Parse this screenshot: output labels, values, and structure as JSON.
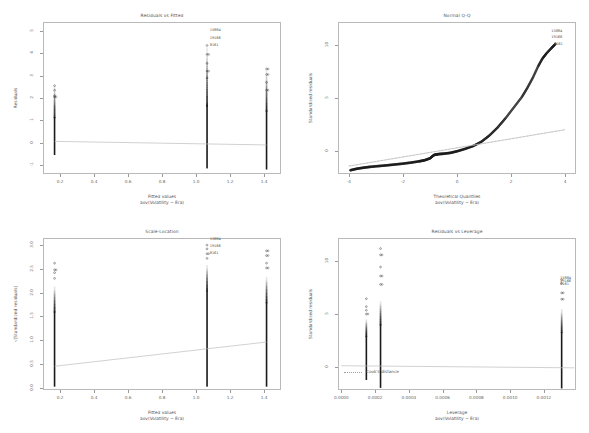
{
  "figure": {
    "kind": "r-diagnostic-plots",
    "panels": 4,
    "model_formula": "aov(Volatility ~ Era)",
    "background": "#ffffff",
    "point_color": "#1a1a1a",
    "line_color": "#bdbdbd",
    "frame_color": "#b9b9b9"
  },
  "chart_data": [
    {
      "type": "scatter",
      "id": "residuals-vs-fitted",
      "title": "Residuals vs Fitted",
      "xlabel": "Fitted values",
      "xsublabel": "aov(Volatility ~ Era)",
      "ylabel": "Residuals",
      "xlim": [
        0.1,
        1.5
      ],
      "ylim": [
        -1.4,
        5.4
      ],
      "xticks": [
        "0.2",
        "0.4",
        "0.6",
        "0.8",
        "1.0",
        "1.2",
        "1.4"
      ],
      "xtickvals": [
        0.2,
        0.4,
        0.6,
        0.8,
        1.0,
        1.2,
        1.4
      ],
      "yticks": [
        "5",
        "4",
        "3",
        "2",
        "1",
        "0",
        "-1"
      ],
      "ytickvals": [
        5,
        4,
        3,
        2,
        1,
        0,
        -1
      ],
      "grid": false,
      "legend": "none",
      "groups": [
        {
          "x": 0.168,
          "ymin": -0.55,
          "ymax": 2.55,
          "dense_to": 1.15,
          "outliers": [
            2.05,
            2.1,
            2.35,
            2.55
          ]
        },
        {
          "x": 1.065,
          "ymin": -1.15,
          "ymax": 4.35,
          "dense_to": 1.7,
          "outliers": [
            2.9,
            3.2,
            3.55,
            3.95,
            4.35
          ]
        },
        {
          "x": 1.415,
          "ymin": -1.2,
          "ymax": 3.3,
          "dense_to": 1.45,
          "outliers": [
            2.35,
            2.7,
            3.05,
            3.3
          ]
        }
      ],
      "smoother": {
        "x0": 0.168,
        "y0": 0.06,
        "x1": 1.415,
        "y1": -0.1
      },
      "point_labels": [
        {
          "text": "15884",
          "x": 1.075,
          "y": 5.05
        },
        {
          "text": "19166",
          "x": 1.075,
          "y": 4.7
        },
        {
          "text": "8161",
          "x": 1.075,
          "y": 4.35
        }
      ]
    },
    {
      "type": "scatter",
      "id": "normal-qq",
      "title": "Normal Q-Q",
      "xlabel": "Theoretical Quantiles",
      "xsublabel": "aov(Volatility ~ Era)",
      "ylabel": "Standardized residuals",
      "xlim": [
        -4.4,
        4.4
      ],
      "ylim": [
        -2.2,
        12.2
      ],
      "xticks": [
        "-4",
        "-2",
        "0",
        "2",
        "4"
      ],
      "xtickvals": [
        -4,
        -2,
        0,
        2,
        4
      ],
      "yticks": [
        "10",
        "5",
        "0"
      ],
      "ytickvals": [
        10,
        5,
        0
      ],
      "grid": false,
      "legend": "none",
      "reference_line": {
        "x0": -4.0,
        "y0": -1.45,
        "x1": 4.0,
        "y1": 2.0
      },
      "qq_curve": [
        [
          -3.95,
          -1.85
        ],
        [
          -3.7,
          -1.7
        ],
        [
          -3.45,
          -1.6
        ],
        [
          -3.2,
          -1.52
        ],
        [
          -2.9,
          -1.45
        ],
        [
          -2.6,
          -1.38
        ],
        [
          -2.3,
          -1.3
        ],
        [
          -2.0,
          -1.22
        ],
        [
          -1.7,
          -1.12
        ],
        [
          -1.4,
          -1.0
        ],
        [
          -1.2,
          -0.9
        ],
        [
          -1.0,
          -0.72
        ],
        [
          -0.85,
          -0.4
        ],
        [
          -0.7,
          -0.32
        ],
        [
          -0.5,
          -0.28
        ],
        [
          -0.25,
          -0.2
        ],
        [
          0.0,
          -0.05
        ],
        [
          0.3,
          0.18
        ],
        [
          0.6,
          0.45
        ],
        [
          0.9,
          0.85
        ],
        [
          1.2,
          1.45
        ],
        [
          1.5,
          2.2
        ],
        [
          1.8,
          3.1
        ],
        [
          2.1,
          4.1
        ],
        [
          2.4,
          5.1
        ],
        [
          2.6,
          5.95
        ],
        [
          2.8,
          6.9
        ],
        [
          3.0,
          8.0
        ],
        [
          3.15,
          8.7
        ],
        [
          3.3,
          9.2
        ],
        [
          3.5,
          9.75
        ],
        [
          3.65,
          10.15
        ]
      ],
      "point_labels": [
        {
          "text": "15884",
          "x": 3.45,
          "y": 11.35
        },
        {
          "text": "19166",
          "x": 3.45,
          "y": 10.75
        },
        {
          "text": "8161",
          "x": 3.55,
          "y": 10.15
        }
      ]
    },
    {
      "type": "scatter",
      "id": "scale-location",
      "title": "Scale-Location",
      "xlabel": "Fitted values",
      "xsublabel": "aov(Volatility ~ Era)",
      "ylabel": "√|Standardized residuals|",
      "xlim": [
        0.1,
        1.5
      ],
      "ylim": [
        -0.05,
        3.15
      ],
      "xticks": [
        "0.2",
        "0.4",
        "0.6",
        "0.8",
        "1.0",
        "1.2",
        "1.4"
      ],
      "xtickvals": [
        0.2,
        0.4,
        0.6,
        0.8,
        1.0,
        1.2,
        1.4
      ],
      "yticks": [
        "3.0",
        "2.5",
        "2.0",
        "1.5",
        "1.0",
        "0.5",
        "0.0"
      ],
      "ytickvals": [
        3.0,
        2.5,
        2.0,
        1.5,
        1.0,
        0.5,
        0.0
      ],
      "grid": false,
      "legend": "none",
      "groups": [
        {
          "x": 0.168,
          "ymin": 0.02,
          "ymax": 2.15,
          "dense_to": 1.6,
          "outliers": [
            2.3,
            2.42,
            2.48,
            2.62
          ]
        },
        {
          "x": 1.065,
          "ymin": 0.02,
          "ymax": 2.6,
          "dense_to": 2.05,
          "outliers": [
            2.72,
            2.82,
            2.92,
            3.0
          ]
        },
        {
          "x": 1.415,
          "ymin": 0.02,
          "ymax": 2.35,
          "dense_to": 1.8,
          "outliers": [
            2.52,
            2.62,
            2.78,
            2.88
          ]
        }
      ],
      "smoother": {
        "x0": 0.168,
        "y0": 0.45,
        "x1": 1.415,
        "y1": 0.96
      },
      "point_labels": [
        {
          "text": "15884",
          "x": 1.075,
          "y": 3.12
        },
        {
          "text": "19166",
          "x": 1.075,
          "y": 2.98
        },
        {
          "text": "8161",
          "x": 1.075,
          "y": 2.84
        }
      ]
    },
    {
      "type": "scatter",
      "id": "residuals-vs-leverage",
      "title": "Residuals vs Leverage",
      "xlabel": "Leverage",
      "xsublabel": "aov(Volatility ~ Era)",
      "ylabel": "Standardized residuals",
      "xlim": [
        -2e-05,
        0.00139
      ],
      "ylim": [
        -2.2,
        12.2
      ],
      "xticks": [
        "0.0000",
        "0.0002",
        "0.0004",
        "0.0006",
        "0.0008",
        "0.0010",
        "0.0012"
      ],
      "xtickvals": [
        0.0,
        0.0002,
        0.0004,
        0.0006,
        0.0008,
        0.001,
        0.0012
      ],
      "yticks": [
        "10",
        "5",
        "0"
      ],
      "ytickvals": [
        10,
        5,
        0
      ],
      "grid": false,
      "legend": "Cook's distance",
      "legend_position": "bottom-left",
      "groups": [
        {
          "x": 0.000148,
          "ymin": -1.25,
          "ymax": 4.55,
          "dense_to": 2.9,
          "outliers": [
            5.0,
            5.35,
            5.7,
            6.45
          ]
        },
        {
          "x": 0.000232,
          "ymin": -2.0,
          "ymax": 6.3,
          "dense_to": 4.0,
          "outliers": [
            7.8,
            8.6,
            9.45,
            10.6,
            11.2
          ]
        },
        {
          "x": 0.001305,
          "ymin": -2.05,
          "ymax": 5.55,
          "dense_to": 3.3,
          "outliers": [
            6.4,
            7.0,
            7.9,
            8.25
          ]
        }
      ],
      "reference_line": {
        "x0": 0.0,
        "y0": 0.1,
        "x1": 0.00138,
        "y1": -0.1
      },
      "point_labels": [
        {
          "text": "15884",
          "x": 0.00129,
          "y": 8.45
        },
        {
          "text": "19166",
          "x": 0.00129,
          "y": 8.15
        },
        {
          "text": "8161",
          "x": 0.00129,
          "y": 7.85
        }
      ]
    }
  ]
}
